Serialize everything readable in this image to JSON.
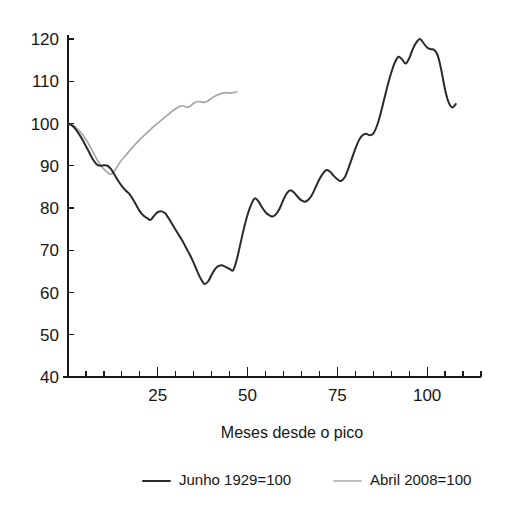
{
  "chart_data": {
    "type": "line",
    "title": "",
    "xlabel": "Meses desde o pico",
    "ylabel": "",
    "xlim": [
      0,
      115
    ],
    "ylim": [
      40,
      120
    ],
    "grid": false,
    "legend_position": "bottom",
    "x_ticks_major": [
      25,
      50,
      75,
      100
    ],
    "x_tick_labels": [
      "25",
      "50",
      "75",
      "100"
    ],
    "x_ticks_minor_step": 5,
    "y_ticks": [
      40,
      50,
      60,
      70,
      80,
      90,
      100,
      110,
      120
    ],
    "y_tick_labels": [
      "40",
      "50",
      "60",
      "70",
      "80",
      "90",
      "100",
      "110",
      "120"
    ],
    "series": [
      {
        "name": "Junho 1929=100",
        "color": "#2a2a2a",
        "x": [
          0,
          1,
          2,
          3,
          4,
          5,
          6,
          7,
          8,
          9,
          10,
          11,
          12,
          13,
          14,
          15,
          16,
          17,
          18,
          19,
          20,
          21,
          22,
          23,
          24,
          25,
          26,
          27,
          28,
          29,
          30,
          31,
          32,
          33,
          34,
          35,
          36,
          37,
          38,
          39,
          40,
          41,
          42,
          43,
          44,
          45,
          46,
          47,
          48,
          49,
          50,
          51,
          52,
          53,
          54,
          55,
          56,
          57,
          58,
          59,
          60,
          61,
          62,
          63,
          64,
          65,
          66,
          67,
          68,
          69,
          70,
          71,
          72,
          73,
          74,
          75,
          76,
          77,
          78,
          79,
          80,
          81,
          82,
          83,
          84,
          85,
          86,
          87,
          88,
          89,
          90,
          91,
          92,
          93,
          94,
          95,
          96,
          97,
          98,
          99,
          100,
          101,
          102,
          103,
          104,
          105,
          106,
          107,
          108
        ],
        "values": [
          100.0,
          99.6,
          98.8,
          97.6,
          96.2,
          94.6,
          93.0,
          91.4,
          90.3,
          90.0,
          90.1,
          90.0,
          89.2,
          87.8,
          86.4,
          85.2,
          84.2,
          83.4,
          82.2,
          80.7,
          79.2,
          78.2,
          77.6,
          77.2,
          78.2,
          79.0,
          79.2,
          78.8,
          77.6,
          76.2,
          74.8,
          73.4,
          72.0,
          70.4,
          68.8,
          67.0,
          65.0,
          63.2,
          62.0,
          62.6,
          64.2,
          65.6,
          66.3,
          66.4,
          66.0,
          65.6,
          65.3,
          67.8,
          71.5,
          75.2,
          78.4,
          80.8,
          82.3,
          81.6,
          80.2,
          79.0,
          78.3,
          78.0,
          78.6,
          80.0,
          82.0,
          83.6,
          84.2,
          83.6,
          82.6,
          81.8,
          81.5,
          82.0,
          83.2,
          85.0,
          86.8,
          88.2,
          89.0,
          88.6,
          87.6,
          86.8,
          86.4,
          87.2,
          89.2,
          91.6,
          94.0,
          96.0,
          97.2,
          97.6,
          97.2,
          97.6,
          99.4,
          102.2,
          105.6,
          109.0,
          112.0,
          114.4,
          115.8,
          115.2,
          114.2,
          115.4,
          117.6,
          119.2,
          120.0,
          119.0,
          118.0,
          117.6,
          117.4,
          116.0,
          112.4,
          108.0,
          105.0,
          103.8,
          104.6
        ]
      },
      {
        "name": "Abril 2008=100",
        "color": "#a6a6a6",
        "x": [
          0,
          1,
          2,
          3,
          4,
          5,
          6,
          7,
          8,
          9,
          10,
          11,
          12,
          13,
          14,
          15,
          16,
          17,
          18,
          19,
          20,
          21,
          22,
          23,
          24,
          25,
          26,
          27,
          28,
          29,
          30,
          31,
          32,
          33,
          34,
          35,
          36,
          37,
          38,
          39,
          40,
          41,
          42,
          43,
          44,
          45,
          46,
          47
        ],
        "values": [
          100.0,
          99.7,
          99.2,
          98.4,
          97.4,
          96.2,
          94.8,
          93.2,
          91.6,
          90.2,
          89.2,
          88.4,
          88.0,
          88.8,
          90.2,
          91.4,
          92.4,
          93.4,
          94.4,
          95.3,
          96.2,
          97.0,
          97.8,
          98.6,
          99.4,
          100.1,
          100.8,
          101.5,
          102.2,
          102.9,
          103.5,
          104.0,
          104.2,
          103.9,
          104.1,
          104.8,
          105.2,
          105.1,
          105.0,
          105.4,
          106.0,
          106.5,
          106.9,
          107.2,
          107.3,
          107.2,
          107.3,
          107.5
        ]
      }
    ]
  },
  "legend": {
    "entries": [
      {
        "label": "Junho 1929=100",
        "color": "#2a2a2a"
      },
      {
        "label": "Abril 2008=100",
        "color": "#a6a6a6"
      }
    ]
  },
  "axis": {
    "x_title": "Meses desde o pico"
  }
}
